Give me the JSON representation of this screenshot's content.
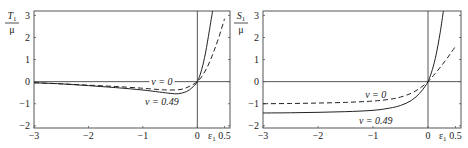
{
  "chart_data": [
    {
      "type": "line",
      "title": "",
      "ylabel": "T1/μ",
      "ylabel_num": "T",
      "ylabel_sub": "1",
      "ylabel_den": "μ",
      "xlabel": "ε1",
      "xlabel_main": "ε",
      "xlabel_sub": "1",
      "xlim": [
        -3,
        0.6
      ],
      "ylim": [
        -2.1,
        3.2
      ],
      "xticks": [
        -3,
        -2,
        -1,
        0,
        0.5
      ],
      "xtick_labels": [
        "−3",
        "−2",
        "−1",
        "0",
        "0.5"
      ],
      "yticks": [
        3,
        2,
        1,
        0,
        -1,
        -2
      ],
      "ytick_labels": [
        "3",
        "2",
        "1",
        "0",
        "−1",
        "−2"
      ],
      "grid": false,
      "reference_lines": {
        "y0": true,
        "x0": true
      },
      "series": [
        {
          "name": "ν = 0",
          "style": "dashed",
          "x": [
            -3,
            -2.5,
            -2,
            -1.5,
            -1,
            -0.7,
            -0.5,
            -0.3,
            -0.15,
            0,
            0.1,
            0.2,
            0.3,
            0.4,
            0.5
          ],
          "y": [
            -0.05,
            -0.1,
            -0.16,
            -0.22,
            -0.3,
            -0.36,
            -0.38,
            -0.35,
            -0.22,
            0,
            0.3,
            0.75,
            1.35,
            2.05,
            2.85
          ]
        },
        {
          "name": "ν = 0.49",
          "style": "solid",
          "x": [
            -3,
            -2.5,
            -2,
            -1.5,
            -1,
            -0.7,
            -0.5,
            -0.35,
            -0.2,
            -0.1,
            0,
            0.08,
            0.15,
            0.22,
            0.28
          ],
          "y": [
            -0.05,
            -0.1,
            -0.18,
            -0.27,
            -0.38,
            -0.47,
            -0.53,
            -0.55,
            -0.45,
            -0.28,
            0,
            0.55,
            1.3,
            2.3,
            3.2
          ]
        }
      ],
      "annotations": [
        {
          "text": "ν = 0",
          "x": -0.65,
          "y": 0
        },
        {
          "text": "ν = 0.49",
          "x": -0.65,
          "y": -0.9
        }
      ]
    },
    {
      "type": "line",
      "title": "",
      "ylabel": "S1/μ",
      "ylabel_num": "S",
      "ylabel_sub": "1",
      "ylabel_den": "μ",
      "xlabel": "ε1",
      "xlabel_main": "ε",
      "xlabel_sub": "1",
      "xlim": [
        -3,
        0.6
      ],
      "ylim": [
        -2.1,
        3.2
      ],
      "xticks": [
        -3,
        -2,
        -1,
        0,
        0.5
      ],
      "xtick_labels": [
        "−3",
        "−2",
        "−1",
        "0",
        "0.5"
      ],
      "yticks": [
        3,
        2,
        1,
        0,
        -1,
        -2
      ],
      "ytick_labels": [
        "3",
        "2",
        "1",
        "0",
        "−1",
        "−2"
      ],
      "grid": false,
      "reference_lines": {
        "y0": true,
        "x0": true
      },
      "series": [
        {
          "name": "ν = 0",
          "style": "dashed",
          "x": [
            -3,
            -2.5,
            -2,
            -1.5,
            -1,
            -0.7,
            -0.5,
            -0.3,
            -0.15,
            0,
            0.1,
            0.2,
            0.3,
            0.4,
            0.5
          ],
          "y": [
            -1.0,
            -0.99,
            -0.97,
            -0.94,
            -0.88,
            -0.8,
            -0.7,
            -0.52,
            -0.3,
            0,
            0.28,
            0.58,
            0.9,
            1.24,
            1.6
          ]
        },
        {
          "name": "ν = 0.49",
          "style": "solid",
          "x": [
            -3,
            -2.5,
            -2,
            -1.5,
            -1,
            -0.7,
            -0.5,
            -0.3,
            -0.15,
            -0.05,
            0,
            0.08,
            0.15,
            0.22,
            0.28
          ],
          "y": [
            -1.42,
            -1.41,
            -1.39,
            -1.36,
            -1.3,
            -1.2,
            -1.08,
            -0.85,
            -0.52,
            -0.2,
            0,
            0.55,
            1.25,
            2.2,
            3.2
          ]
        }
      ],
      "annotations": [
        {
          "text": "ν = 0",
          "x": -0.95,
          "y": -0.6
        },
        {
          "text": "ν = 0.49",
          "x": -0.95,
          "y": -1.78
        }
      ]
    }
  ]
}
